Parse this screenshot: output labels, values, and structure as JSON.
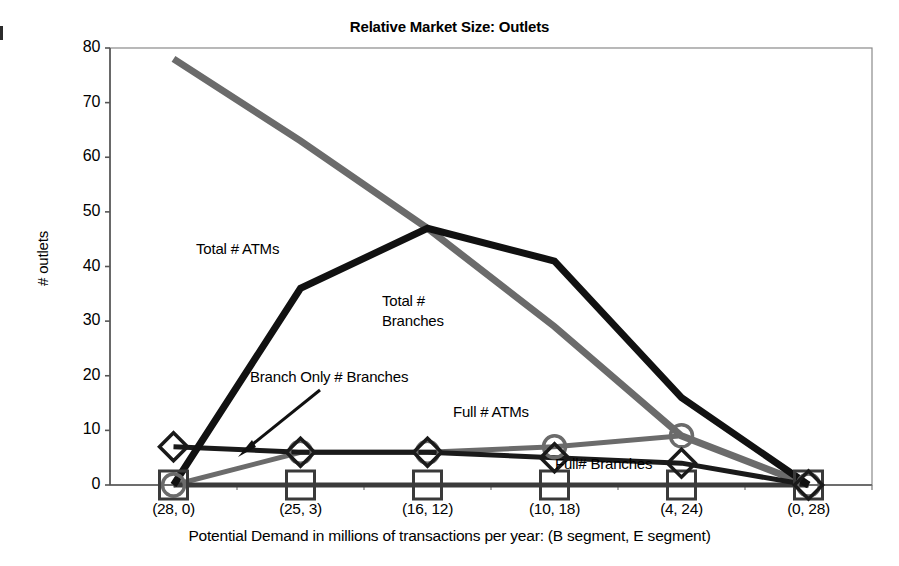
{
  "chart_data": {
    "type": "line",
    "title": "Relative Market Size: Outlets",
    "xlabel": "Potential Demand in millions of transactions per year: (B segment, E segment)",
    "ylabel": "# outlets",
    "categories": [
      "(28, 0)",
      "(25, 3)",
      "(16, 12)",
      "(10, 18)",
      "(4, 24)",
      "(0, 28)"
    ],
    "ylim": [
      0,
      80
    ],
    "yticks": [
      0,
      10,
      20,
      30,
      40,
      50,
      60,
      70,
      80
    ],
    "ytick_labels": [
      "0",
      "10",
      "20",
      "30",
      "40",
      "50",
      "60",
      "70",
      "80"
    ],
    "grid": false,
    "legend": "annotations-on-plot",
    "series": [
      {
        "name": "Total # ATMs",
        "color": "#6b6b6b",
        "marker": "none",
        "width": 7,
        "values": [
          78,
          63,
          47,
          29,
          9,
          0
        ]
      },
      {
        "name": "Total # Branches",
        "color": "#111111",
        "marker": "none",
        "width": 7,
        "values": [
          0,
          36,
          47,
          41,
          16,
          0
        ]
      },
      {
        "name": "Full # ATMs",
        "color": "#6b6b6b",
        "marker": "circle",
        "width": 5,
        "values": [
          0,
          6,
          6,
          7,
          9,
          0
        ]
      },
      {
        "name": "Full# Branches",
        "color": "#3a3a3a",
        "marker": "square",
        "width": 5,
        "values": [
          0,
          0,
          0,
          0,
          0,
          0
        ]
      },
      {
        "name": "Branch Only # Branches",
        "color": "#1a1a1a",
        "marker": "diamond",
        "width": 5,
        "values": [
          7,
          6,
          6,
          5,
          4,
          0
        ]
      }
    ],
    "annotations": [
      {
        "text": "Total # ATMs",
        "x": 196,
        "y": 240
      },
      {
        "text": "Total #",
        "x": 382,
        "y": 292
      },
      {
        "text": "Branches",
        "x": 382,
        "y": 312
      },
      {
        "text": "Branch Only # Branches",
        "x": 250,
        "y": 368
      },
      {
        "text": "Full # ATMs",
        "x": 453,
        "y": 403
      },
      {
        "text": "Full# Branches",
        "x": 555,
        "y": 455
      }
    ]
  }
}
